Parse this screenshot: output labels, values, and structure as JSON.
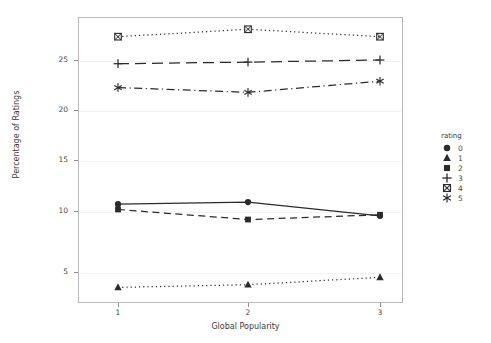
{
  "chart_data": {
    "type": "line",
    "title": "",
    "xlabel": "Global Popularity",
    "ylabel": "Percentage of Ratings",
    "x": [
      1,
      2,
      3
    ],
    "categories": [
      "1",
      "2",
      "3"
    ],
    "xtick_labels": [
      "1",
      "2",
      "3"
    ],
    "ytick_labels": [
      "5",
      "10",
      "15",
      "20",
      "25"
    ],
    "ytick_values": [
      5,
      10,
      15,
      20,
      25
    ],
    "xlim": [
      0.6,
      3.4
    ],
    "ylim": [
      2.0,
      29.0
    ],
    "grid": true,
    "legend_position": "right",
    "legend_title": "rating",
    "series": [
      {
        "name": "0",
        "label": "0",
        "marker": "circle",
        "linestyle": "solid",
        "color": "#2b2b2b",
        "values": [
          11.4,
          11.6,
          10.3
        ]
      },
      {
        "name": "1",
        "label": "1",
        "marker": "triangle",
        "linestyle": "dotted",
        "color": "#2b2b2b",
        "values": [
          3.55,
          3.8,
          4.5
        ]
      },
      {
        "name": "2",
        "label": "2",
        "marker": "square",
        "linestyle": "dashed",
        "color": "#2b2b2b",
        "values": [
          10.9,
          9.95,
          10.4
        ]
      },
      {
        "name": "3",
        "label": "3",
        "marker": "plus",
        "linestyle": "longdash",
        "color": "#2b2b2b",
        "values": [
          24.65,
          24.8,
          25.0
        ]
      },
      {
        "name": "4",
        "label": "4",
        "marker": "crossed-square",
        "linestyle": "dotted",
        "color": "#2b2b2b",
        "values": [
          27.2,
          27.9,
          27.2
        ]
      },
      {
        "name": "5",
        "label": "5",
        "marker": "asterisk",
        "linestyle": "dashdot",
        "color": "#2b2b2b",
        "values": [
          22.4,
          21.95,
          23.0
        ]
      }
    ]
  },
  "axes": {
    "ylabel": "Percentage of Ratings",
    "xlabel": "Global Popularity"
  },
  "legend": {
    "title": "rating",
    "items": [
      {
        "label": "0",
        "marker": "circle-marker-icon"
      },
      {
        "label": "1",
        "marker": "triangle-marker-icon"
      },
      {
        "label": "2",
        "marker": "square-marker-icon"
      },
      {
        "label": "3",
        "marker": "plus-marker-icon"
      },
      {
        "label": "4",
        "marker": "crossed-square-marker-icon"
      },
      {
        "label": "5",
        "marker": "asterisk-marker-icon"
      }
    ]
  }
}
